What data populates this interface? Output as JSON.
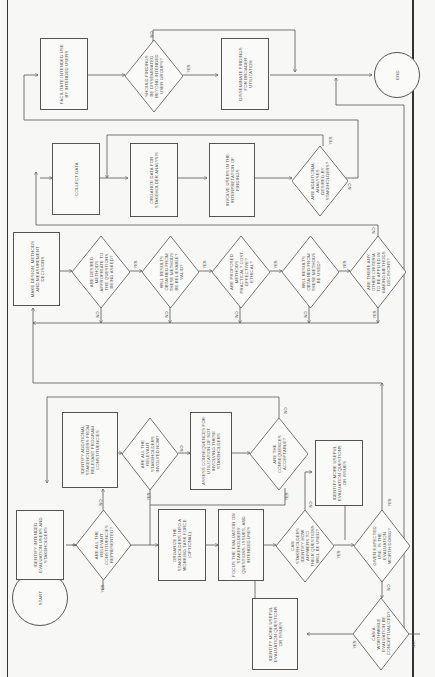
{
  "diagram": {
    "orientation": "rotated-90-ccw",
    "terminals": {
      "start": "START",
      "end": "END"
    },
    "stage1": {
      "identify_users": "IDENTIFY INTENDED EVALUATION USERS AND STAKEHOLDERS",
      "q_constituencies": "ARE ALL THE RELEVANT CONSTITUENCIES REPRESENTED?",
      "identify_additional": "IDENTIFY ADDITIONAL STAKEHOLDERS FROM RELEVANT PROGRAM CONSTITUENCIES",
      "q_involved": "ARE ALL THE RELEVANT STAKEHOLDERS INVOLVED NOW?",
      "assess_consequences": "ASSESS CONSEQUENCES FOR UTILIZATION OF NOT INVOLVING THESE STAKEHOLDERS",
      "q_acceptable": "ARE THE CONSEQUENCES ACCEPTABLE?",
      "organize_task_force": "ORGANIZE THE STAKEHOLDERS INTO A WORKING TASK FORCE (OPTIONAL)",
      "focus_evaluation": "FOCUS THE EVALUATION ON STAKEHOLDERS' QUESTIONS, ISSUES, AND INTENDED USES",
      "q_identify_use": "CAN STAKEHOLDERS IDENTIFY HOW ANSWERS TO THEIR QUESTIONS WILL BE USED?",
      "identify_more_1": "IDENTIFY MORE USEFUL EVALUATION QUESTIONS OR ISSUES",
      "q_expected_use": "GIVEN EXPECTED USE, IS THE EVALUATION WORTH DOING?",
      "q_worthwhile": "CAN A WORTHWHILE EVALUATION BE CONCEPTUALIZED?",
      "identify_more_2": "IDENTIFY MORE USEFUL EVALUATION QUESTIONS OR ISSUES"
    },
    "stage2": {
      "make_design": "MAKE DESIGN, METHODS AND MEASUREMENT DECISIONS",
      "q_appropriate": "ARE DESIRED METHODS APPROPRIATE TO THE QUESTIONS BEING ASKED?",
      "q_believable": "WILL RESULTS OBTAINED FROM THESE METHODS BE BELIEVABLE? VALID?",
      "q_practical": "ARE PROPOSED METHODS PRACTICAL? COST-EFFECTIVE? ETHICAL?",
      "q_used": "WILL RESULTS OBTAINED FROM THESE METHODS BE USED?",
      "q_other_criteria": "ARE THERE ANY OTHER CRITERIA TO BE APPLIED IN MAKING METHODS DECISIONS?"
    },
    "stage3": {
      "collect_data": "COLLECT DATA",
      "organize_data": "ORGANIZE DATA FOR STAKEHOLDER ANALYSIS",
      "involve_users": "INVOLVE USERS IN THE INTERPRETATION OF FINDINGS",
      "q_additional_analysis": "ARE ADDITIONAL ANALYSES DESIRED BY STAKEHOLDERS?"
    },
    "stage4": {
      "facilitate_use": "FACILITATE INTENDED USE BY INTENDED USERS",
      "q_disseminate": "SHOULD FINDINGS BE DISSEMINATED BEYOND INTENDED USER GROUPS?",
      "disseminate": "DISSEMINATE FINDINGS FOR BROADER UTILIZATION"
    },
    "labels": {
      "yes": "YES",
      "no": "NO"
    }
  }
}
